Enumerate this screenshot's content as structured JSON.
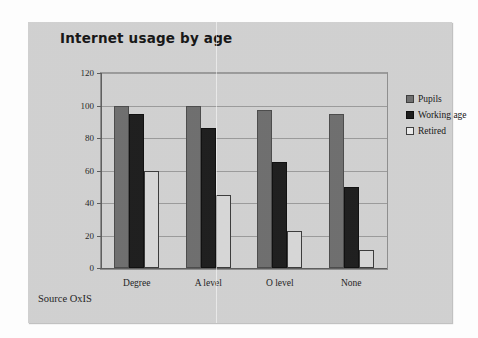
{
  "slide": {
    "title": "Internet usage by age",
    "source_note": "Source OxIS"
  },
  "legend": {
    "position": "right",
    "items": [
      {
        "label": "Pupils",
        "swatch": "pupils",
        "color": "#6e6e6e"
      },
      {
        "label": "Working age",
        "swatch": "working",
        "color": "#1c1c1c"
      },
      {
        "label": "Retired",
        "swatch": "retired",
        "color": "#d8d8d8"
      }
    ]
  },
  "axis": {
    "y_ticks": [
      "0",
      "20",
      "40",
      "60",
      "80",
      "100",
      "120"
    ],
    "categories": [
      "Degree",
      "A level",
      "O level",
      "None"
    ]
  },
  "chart_data": {
    "type": "bar",
    "title": "Internet usage by age",
    "xlabel": "",
    "ylabel": "",
    "ylim": [
      0,
      120
    ],
    "yticks": [
      0,
      20,
      40,
      60,
      80,
      100,
      120
    ],
    "grid": true,
    "legend_position": "right",
    "categories": [
      "Degree",
      "A level",
      "O level",
      "None"
    ],
    "series": [
      {
        "name": "Pupils",
        "color": "#6e6e6e",
        "values": [
          100,
          100,
          97,
          95
        ]
      },
      {
        "name": "Working age",
        "color": "#1c1c1c",
        "values": [
          95,
          86,
          65,
          50
        ]
      },
      {
        "name": "Retired",
        "color": "#d8d8d8",
        "values": [
          60,
          45,
          23,
          11
        ]
      }
    ],
    "annotations": [
      "Source OxIS"
    ]
  }
}
